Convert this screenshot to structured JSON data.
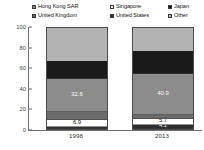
{
  "legend": {
    "items": [
      {
        "label": "Hong Kong SAR",
        "color": "#8c8c8c"
      },
      {
        "label": "Singapore",
        "color": "#ffffff"
      },
      {
        "label": "Japan",
        "color": "#1a1a1a"
      },
      {
        "label": "United Kingdom",
        "color": "#6b6b6b"
      },
      {
        "label": "United States",
        "color": "#2e2e2e"
      },
      {
        "label": "Other",
        "color": "#b3b3b3"
      }
    ]
  },
  "axis": {
    "yticks": [
      "0",
      "20",
      "40",
      "60",
      "80",
      "100"
    ],
    "ymin": 0,
    "ymax": 100,
    "xlabels": [
      "1998",
      "2013"
    ]
  },
  "chart_data": {
    "type": "bar",
    "subtype": "stacked-vertical-100",
    "title": "",
    "xlabel": "",
    "ylabel": "",
    "ylim": [
      0,
      100
    ],
    "grid": false,
    "legend_position": "top",
    "categories": [
      "1998",
      "2013"
    ],
    "series": [
      {
        "name": "United States",
        "color": "#2e2e2e",
        "values": [
          1.6,
          4.1
        ],
        "labels": [
          "",
          "4.1"
        ]
      },
      {
        "name": "Singapore",
        "color": "#ffffff",
        "values": [
          6.9,
          5.7
        ],
        "labels": [
          "6.9",
          "5.7"
        ]
      },
      {
        "name": "United Kingdom",
        "color": "#6b6b6b",
        "values": [
          8.2,
          4.0
        ],
        "labels": [
          "",
          ""
        ]
      },
      {
        "name": "Hong Kong SAR",
        "color": "#8c8c8c",
        "values": [
          32.6,
          40.9
        ],
        "labels": [
          "32.6",
          "40.9"
        ]
      },
      {
        "name": "Japan",
        "color": "#1a1a1a",
        "values": [
          18.0,
          22.0
        ],
        "labels": [
          "",
          ""
        ]
      },
      {
        "name": "Other",
        "color": "#b3b3b3",
        "values": [
          32.7,
          23.3
        ],
        "labels": [
          "",
          ""
        ]
      }
    ]
  }
}
